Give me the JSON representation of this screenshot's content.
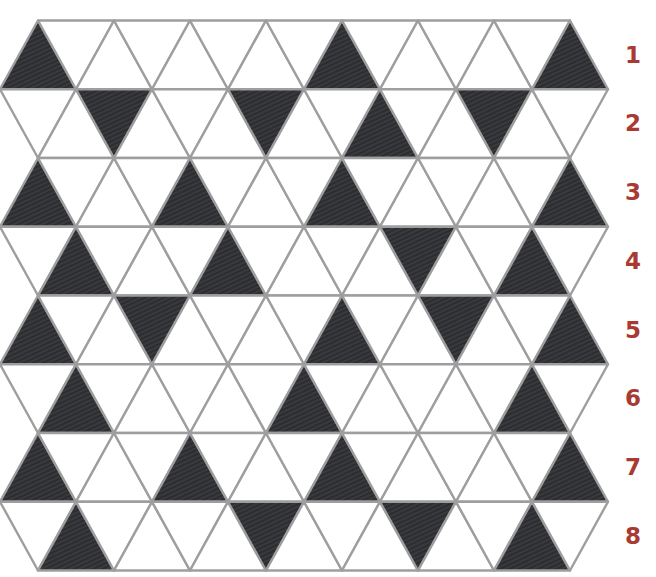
{
  "puzzle": {
    "type": "triangle-grid-pattern",
    "rows": 8,
    "triangles_per_row": 15,
    "colors": {
      "filled": "#2b2d30",
      "line": "#9e9e9e",
      "label": "#a83a32",
      "background": "#ffffff"
    },
    "row_labels": [
      "1",
      "2",
      "3",
      "4",
      "5",
      "6",
      "7",
      "8"
    ],
    "shaded_cells": [
      {
        "row": 1,
        "indices": [
          0,
          8,
          14
        ]
      },
      {
        "row": 2,
        "indices": [
          2,
          6,
          9,
          12
        ]
      },
      {
        "row": 3,
        "indices": [
          0,
          4,
          8,
          14
        ]
      },
      {
        "row": 4,
        "indices": [
          1,
          5,
          10,
          13
        ]
      },
      {
        "row": 5,
        "indices": [
          0,
          3,
          8,
          11,
          14
        ]
      },
      {
        "row": 6,
        "indices": [
          1,
          7,
          13
        ]
      },
      {
        "row": 7,
        "indices": [
          0,
          4,
          8,
          14
        ]
      },
      {
        "row": 8,
        "indices": [
          1,
          6,
          10,
          13
        ]
      }
    ]
  }
}
